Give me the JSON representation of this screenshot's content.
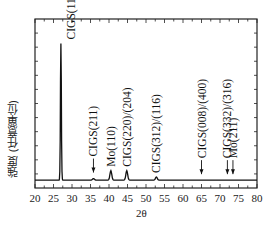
{
  "chart_data": {
    "type": "line",
    "title": "",
    "xlabel": "2θ",
    "ylabel": "強度 (任意單位)",
    "xlim": [
      20,
      80
    ],
    "xticks": [
      20,
      25,
      30,
      35,
      40,
      45,
      50,
      55,
      60,
      65,
      70,
      75,
      80
    ],
    "ylim": [
      0,
      1
    ],
    "grid": false,
    "legend": null,
    "baseline": 0.05,
    "peaks": [
      {
        "x": 27.0,
        "height": 0.92,
        "label": "CIGS(112)",
        "arrow": false
      },
      {
        "x": 35.8,
        "height": 0.06,
        "label": "CIGS(211)",
        "arrow": true
      },
      {
        "x": 40.5,
        "height": 0.11,
        "label": "Mo(110)",
        "arrow": false
      },
      {
        "x": 44.8,
        "height": 0.11,
        "label": "CIGS(220)/(204)",
        "arrow": false
      },
      {
        "x": 52.8,
        "height": 0.07,
        "label": "CIGS(312)/(116)",
        "arrow": false
      },
      {
        "x": 65.0,
        "height": 0.05,
        "label": "CIGS(008)/(400)",
        "arrow": true
      },
      {
        "x": 72.0,
        "height": 0.05,
        "label": "CIGS(332)/(316)",
        "arrow": true
      },
      {
        "x": 73.5,
        "height": 0.05,
        "label": "Mo(211)",
        "arrow": true
      }
    ]
  }
}
